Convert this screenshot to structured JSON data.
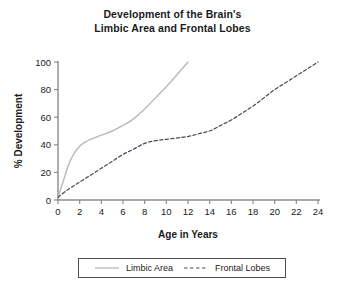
{
  "chart_data": {
    "type": "line",
    "title": "Development of the Brain's Limbic Area and Frontal Lobes",
    "title_lines": [
      "Development of the Brain's",
      "Limbic Area and Frontal Lobes"
    ],
    "xlabel": "Age in Years",
    "ylabel": "% Development",
    "xlim": [
      0,
      24
    ],
    "ylim": [
      0,
      100
    ],
    "xticks": [
      0,
      2,
      4,
      6,
      8,
      10,
      12,
      14,
      16,
      18,
      20,
      22,
      24
    ],
    "yticks": [
      0,
      20,
      40,
      60,
      80,
      100
    ],
    "grid": false,
    "legend_position": "bottom",
    "series": [
      {
        "name": "Limbic Area",
        "style": "solid",
        "color": "#b9b9b9",
        "x": [
          0,
          0.5,
          1,
          1.5,
          2,
          2.5,
          3,
          4,
          5,
          6,
          7,
          8,
          9,
          10,
          11,
          12
        ],
        "values": [
          2,
          14,
          26,
          34,
          39,
          42,
          44,
          47,
          50,
          54,
          59,
          66,
          74,
          82,
          91,
          100
        ]
      },
      {
        "name": "Frontal Lobes",
        "style": "dashed",
        "color": "#4a4a58",
        "x": [
          0,
          1,
          2,
          3,
          4,
          5,
          6,
          7,
          8,
          9,
          10,
          11,
          12,
          13,
          14,
          15,
          16,
          17,
          18,
          19,
          20,
          21,
          22,
          23,
          24
        ],
        "values": [
          2,
          8,
          13,
          18,
          23,
          28,
          33,
          37,
          41,
          43,
          44,
          45,
          46,
          48,
          50,
          54,
          58,
          63,
          68,
          74,
          80,
          85,
          90,
          95,
          100
        ]
      }
    ]
  },
  "legend": {
    "entries": [
      {
        "label": "Limbic Area"
      },
      {
        "label": "Frontal Lobes"
      }
    ]
  },
  "axis_tick_labels": {
    "x": [
      "0",
      "2",
      "4",
      "6",
      "8",
      "10",
      "12",
      "14",
      "16",
      "18",
      "20",
      "22",
      "24"
    ],
    "y": [
      "0",
      "20",
      "40",
      "60",
      "80",
      "100"
    ]
  }
}
